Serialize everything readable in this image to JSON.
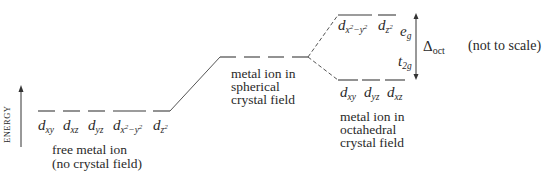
{
  "diagram": {
    "axis": {
      "label": "ENERGY"
    },
    "free_ion": {
      "orbitals": [
        {
          "base": "d",
          "sub": "xy"
        },
        {
          "base": "d",
          "sub": "xz"
        },
        {
          "base": "d",
          "sub": "yz"
        },
        {
          "base": "d",
          "sub": "x",
          "sup1": "2",
          "mid": "−y",
          "sup2": "2"
        },
        {
          "base": "d",
          "sub": "z",
          "sup1": "2"
        }
      ],
      "caption_line1": "free metal ion",
      "caption_line2": "(no crystal field)"
    },
    "spherical": {
      "caption_line1": "metal ion in",
      "caption_line2": "spherical",
      "caption_line3": "crystal field"
    },
    "octahedral": {
      "eg_label": {
        "base": "e",
        "sub": "g"
      },
      "t2g_label": {
        "base": "t",
        "sub": "2g"
      },
      "eg_orbitals": [
        {
          "base": "d",
          "sub": "x",
          "sup1": "2",
          "mid": "−y",
          "sup2": "2"
        },
        {
          "base": "d",
          "sub": "z",
          "sup1": "2"
        }
      ],
      "t2g_orbitals": [
        {
          "base": "d",
          "sub": "xy"
        },
        {
          "base": "d",
          "sub": "yz"
        },
        {
          "base": "d",
          "sub": "xz"
        }
      ],
      "caption_line1": "metal ion in",
      "caption_line2": "octahedral",
      "caption_line3": "crystal field"
    },
    "splitting": {
      "symbol": "Δ",
      "sub": "oct"
    },
    "note": "(not to scale)"
  }
}
